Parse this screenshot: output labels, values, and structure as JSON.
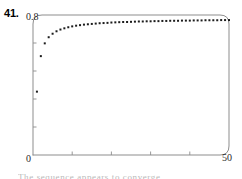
{
  "figure": {
    "problem_number": "41.",
    "bottom_caption_sliver": "The sequence appears to converge"
  },
  "colors": {
    "frame": "#8d8d8d",
    "point": "#1c1c1c",
    "tick": "#8d8d8d",
    "text": "#1a1a1a",
    "background": "#ffffff"
  },
  "chart_data": {
    "type": "scatter",
    "title": "",
    "xlabel": "",
    "ylabel": "",
    "xlim": [
      0,
      50
    ],
    "ylim": [
      0,
      0.8
    ],
    "grid": false,
    "legend": null,
    "x_tick_labels": [
      "0",
      "50"
    ],
    "y_tick_labels": [
      "0.8"
    ],
    "x_tick_values": [
      0,
      50
    ],
    "y_tick_values": [
      0.8
    ],
    "x_minor_tick_values": [
      10,
      20,
      30,
      40
    ],
    "y_minor_tick_values": [
      0.16,
      0.32,
      0.48,
      0.64
    ],
    "marker": "square",
    "marker_size_px": 2,
    "series": [
      {
        "name": "a_n",
        "x": [
          1,
          2,
          3,
          4,
          5,
          6,
          7,
          8,
          9,
          10,
          11,
          12,
          13,
          14,
          15,
          16,
          17,
          18,
          19,
          20,
          21,
          22,
          23,
          24,
          25,
          26,
          27,
          28,
          29,
          30,
          31,
          32,
          33,
          34,
          35,
          36,
          37,
          38,
          39,
          40,
          41,
          42,
          43,
          44,
          45,
          46,
          47,
          48,
          49,
          50
        ],
        "y": [
          0.362,
          0.565,
          0.638,
          0.673,
          0.693,
          0.707,
          0.717,
          0.724,
          0.73,
          0.735,
          0.739,
          0.742,
          0.745,
          0.747,
          0.749,
          0.751,
          0.753,
          0.754,
          0.755,
          0.757,
          0.758,
          0.759,
          0.76,
          0.76,
          0.761,
          0.762,
          0.763,
          0.763,
          0.764,
          0.764,
          0.765,
          0.765,
          0.766,
          0.766,
          0.767,
          0.767,
          0.767,
          0.768,
          0.768,
          0.768,
          0.769,
          0.769,
          0.769,
          0.77,
          0.77,
          0.77,
          0.77,
          0.771,
          0.771,
          0.771
        ]
      }
    ]
  }
}
